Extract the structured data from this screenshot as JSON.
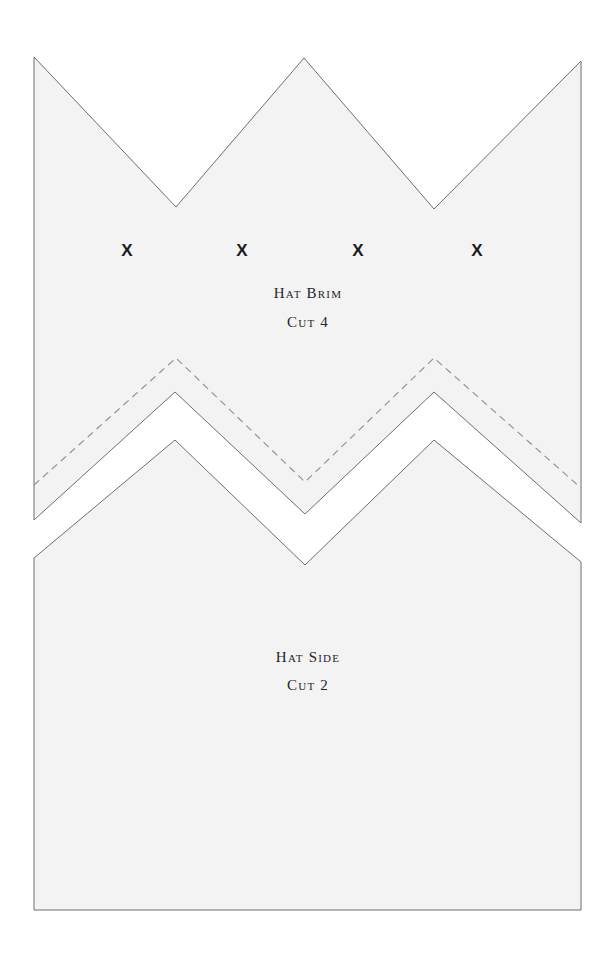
{
  "document": {
    "kind": "sewing-pattern-sheet",
    "background_color": "#ffffff",
    "piece_fill_color": "#f3f3f3",
    "outline_color": "#6e6e73",
    "fold_line_color": "#8d8d92",
    "text_color": "#25252b",
    "width": 616,
    "height": 955
  },
  "pieces": [
    {
      "id": "hat-brim",
      "name_label": "Hat Brim",
      "cut_label": "Cut 4",
      "label_positions": {
        "name_y": 285,
        "cut_y": 314
      },
      "outline_points": "34,57 176,207 304,58 434,209 581,61 581,523 434,392 305,514 175,392 34,520",
      "fold_line_points": "34,485 176,358 305,482 434,358 581,488",
      "marks": [
        {
          "glyph": "X",
          "x": 127,
          "y": 250
        },
        {
          "glyph": "X",
          "x": 242,
          "y": 250
        },
        {
          "glyph": "X",
          "x": 358,
          "y": 250
        },
        {
          "glyph": "X",
          "x": 477,
          "y": 250
        }
      ]
    },
    {
      "id": "hat-side",
      "name_label": "Hat Side",
      "cut_label": "Cut 2",
      "label_positions": {
        "name_y": 649,
        "cut_y": 677
      },
      "outline_points": "34,558 175,440 305,565 434,440 581,562 581,910 34,910",
      "fold_line_points": "",
      "marks": []
    }
  ],
  "geometry": {
    "sheet_left": 34,
    "sheet_right": 581,
    "brim_top_peaks_y": [
      57,
      58,
      61
    ],
    "brim_valleys_y": [
      207,
      209
    ],
    "side_bottom_y": 910
  }
}
